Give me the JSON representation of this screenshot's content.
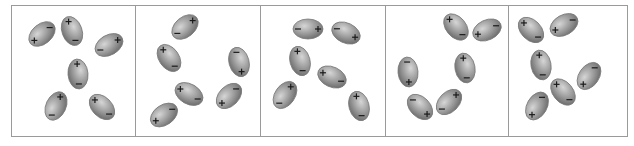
{
  "figure": {
    "frame": {
      "x": 11,
      "y": 5,
      "width": 616,
      "height": 131,
      "stroke": "#9a9a9a"
    },
    "dividers": [
      135,
      260,
      385,
      508
    ],
    "colors": {
      "molecule_light": "#c8c8c8",
      "molecule_mid": "#9a9a9a",
      "molecule_dark": "#6f6f6f",
      "molecule_edge": "#7a7a7a",
      "sign": "#1a1a1a"
    },
    "plus_symbol": "+",
    "minus_symbol": "−",
    "panels": [
      {
        "label": "panel-1",
        "molecules": [
          {
            "cx": 42,
            "cy": 34,
            "rx": 15,
            "ry": 10,
            "angle": -40,
            "plus": "neg"
          },
          {
            "cx": 72,
            "cy": 31,
            "rx": 15,
            "ry": 10,
            "angle": 70,
            "plus": "neg"
          },
          {
            "cx": 109,
            "cy": 45,
            "rx": 15,
            "ry": 10,
            "angle": -30,
            "plus": "pos"
          },
          {
            "cx": 78,
            "cy": 74,
            "rx": 15,
            "ry": 10,
            "angle": 85,
            "plus": "neg"
          },
          {
            "cx": 56,
            "cy": 106,
            "rx": 15,
            "ry": 10,
            "angle": -65,
            "plus": "pos"
          },
          {
            "cx": 102,
            "cy": 107,
            "rx": 15,
            "ry": 10,
            "angle": 45,
            "plus": "neg"
          }
        ]
      },
      {
        "label": "panel-2",
        "molecules": [
          {
            "cx": 185,
            "cy": 27,
            "rx": 15,
            "ry": 10,
            "angle": -40,
            "plus": "pos"
          },
          {
            "cx": 169,
            "cy": 58,
            "rx": 15,
            "ry": 10,
            "angle": 55,
            "plus": "neg"
          },
          {
            "cx": 239,
            "cy": 62,
            "rx": 15,
            "ry": 10,
            "angle": 75,
            "plus": "pos"
          },
          {
            "cx": 189,
            "cy": 94,
            "rx": 15,
            "ry": 10,
            "angle": 30,
            "plus": "neg"
          },
          {
            "cx": 229,
            "cy": 96,
            "rx": 15,
            "ry": 10,
            "angle": -45,
            "plus": "neg"
          },
          {
            "cx": 164,
            "cy": 115,
            "rx": 15,
            "ry": 10,
            "angle": -35,
            "plus": "neg"
          }
        ]
      },
      {
        "label": "panel-3",
        "molecules": [
          {
            "cx": 308,
            "cy": 29,
            "rx": 15,
            "ry": 10,
            "angle": 0,
            "plus": "pos"
          },
          {
            "cx": 346,
            "cy": 33,
            "rx": 15,
            "ry": 10,
            "angle": 25,
            "plus": "pos"
          },
          {
            "cx": 300,
            "cy": 61,
            "rx": 15,
            "ry": 10,
            "angle": 75,
            "plus": "neg"
          },
          {
            "cx": 332,
            "cy": 77,
            "rx": 15,
            "ry": 10,
            "angle": 25,
            "plus": "neg"
          },
          {
            "cx": 285,
            "cy": 95,
            "rx": 15,
            "ry": 10,
            "angle": -55,
            "plus": "pos"
          },
          {
            "cx": 359,
            "cy": 106,
            "rx": 15,
            "ry": 10,
            "angle": 75,
            "plus": "neg"
          }
        ]
      },
      {
        "label": "panel-4",
        "molecules": [
          {
            "cx": 456,
            "cy": 27,
            "rx": 15,
            "ry": 10,
            "angle": 50,
            "plus": "neg"
          },
          {
            "cx": 487,
            "cy": 30,
            "rx": 15,
            "ry": 10,
            "angle": -25,
            "plus": "neg"
          },
          {
            "cx": 408,
            "cy": 72,
            "rx": 15,
            "ry": 10,
            "angle": 85,
            "plus": "pos"
          },
          {
            "cx": 465,
            "cy": 68,
            "rx": 15,
            "ry": 10,
            "angle": 80,
            "plus": "neg"
          },
          {
            "cx": 420,
            "cy": 107,
            "rx": 15,
            "ry": 10,
            "angle": 45,
            "plus": "pos"
          },
          {
            "cx": 449,
            "cy": 102,
            "rx": 15,
            "ry": 10,
            "angle": -45,
            "plus": "pos"
          }
        ]
      },
      {
        "label": "panel-5",
        "molecules": [
          {
            "cx": 531,
            "cy": 30,
            "rx": 15,
            "ry": 10,
            "angle": 45,
            "plus": "neg"
          },
          {
            "cx": 564,
            "cy": 25,
            "rx": 15,
            "ry": 10,
            "angle": -30,
            "plus": "neg"
          },
          {
            "cx": 541,
            "cy": 65,
            "rx": 15,
            "ry": 10,
            "angle": 80,
            "plus": "neg"
          },
          {
            "cx": 589,
            "cy": 76,
            "rx": 15,
            "ry": 10,
            "angle": -55,
            "plus": "neg"
          },
          {
            "cx": 563,
            "cy": 92,
            "rx": 15,
            "ry": 10,
            "angle": 50,
            "plus": "neg"
          },
          {
            "cx": 537,
            "cy": 106,
            "rx": 15,
            "ry": 10,
            "angle": -60,
            "plus": "neg"
          }
        ]
      }
    ]
  }
}
